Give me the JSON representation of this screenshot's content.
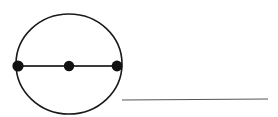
{
  "figure": {
    "title": "Circle with horizontal diameter and three marked points",
    "background_color": "#ffffff",
    "stroke_color": "#1a1a1a",
    "segment_color": "#555555",
    "dot_color": "#111111",
    "width": 278,
    "height": 117
  },
  "chart_data": {
    "type": "diagram",
    "title": "Circle with horizontal diameter and three marked points",
    "shapes": [
      {
        "name": "circle",
        "kind": "circle",
        "center_x": 69,
        "center_y": 64,
        "radius_x": 53,
        "radius_y": 50,
        "stroke": "#1a1a1a",
        "stroke_width": 1.6,
        "fill": "none"
      },
      {
        "name": "diameter-line",
        "kind": "line",
        "x1": 18,
        "y1": 66,
        "x2": 118,
        "y2": 66,
        "stroke": "#3a3a3a",
        "stroke_width": 2.2
      },
      {
        "name": "baseline-segment",
        "kind": "line",
        "x1": 122,
        "y1": 100,
        "x2": 268,
        "y2": 99,
        "stroke": "#555555",
        "stroke_width": 1.2
      }
    ],
    "points": [
      {
        "name": "left-endpoint-dot",
        "label": "",
        "x": 18,
        "y": 66,
        "radius": 5.6,
        "fill": "#111111"
      },
      {
        "name": "center-dot",
        "label": "",
        "x": 69,
        "y": 66,
        "radius": 5.2,
        "fill": "#111111"
      },
      {
        "name": "right-endpoint-dot",
        "label": "",
        "x": 117,
        "y": 66,
        "radius": 5.4,
        "fill": "#111111"
      }
    ],
    "labels": [],
    "annotations": []
  }
}
